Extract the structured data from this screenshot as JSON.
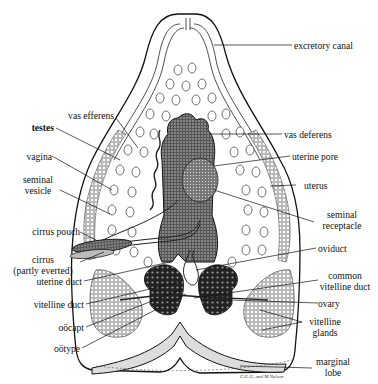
{
  "figure": {
    "signature": "C.G.G. and M.Nelson",
    "colors": {
      "ink": "#111111",
      "paper": "#ffffff",
      "stipple": "#3a3a3a"
    }
  },
  "labels": {
    "left": [
      {
        "id": "vas-efferens",
        "text": "vas efferens"
      },
      {
        "id": "testes",
        "text": "testes"
      },
      {
        "id": "vagina",
        "text": "vagina"
      },
      {
        "id": "seminal-vesicle",
        "line1": "seminal",
        "line2": "vesicle"
      },
      {
        "id": "cirrus-pouch",
        "text": "cirrus pouch"
      },
      {
        "id": "cirrus",
        "line1": "cirrus",
        "line2": "(partly everted)"
      },
      {
        "id": "uterine-duct",
        "text": "uterine duct"
      },
      {
        "id": "vitelline-duct",
        "text": "vitelline duct"
      },
      {
        "id": "oocapt",
        "text": "oöcapt"
      },
      {
        "id": "ootype",
        "text": "oötype"
      }
    ],
    "right": [
      {
        "id": "excretory-canal",
        "text": "excretory canal"
      },
      {
        "id": "vas-deferens",
        "text": "vas deferens"
      },
      {
        "id": "uterine-pore",
        "text": "uterine pore"
      },
      {
        "id": "uterus",
        "text": "uterus"
      },
      {
        "id": "seminal-receptacle",
        "line1": "seminal",
        "line2": "receptacle"
      },
      {
        "id": "oviduct",
        "text": "oviduct"
      },
      {
        "id": "common-vitelline-duct",
        "line1": "common",
        "line2": "vitelline duct"
      },
      {
        "id": "ovary",
        "text": "ovary"
      },
      {
        "id": "vitelline-glands",
        "line1": "vitelline",
        "line2": "glands"
      },
      {
        "id": "marginal-lobe",
        "line1": "marginal",
        "line2": "lobe"
      }
    ]
  }
}
